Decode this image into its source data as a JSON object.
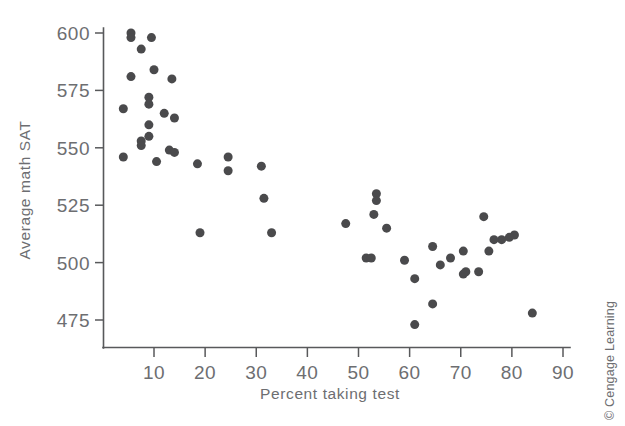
{
  "chart_data": {
    "type": "scatter",
    "title": "",
    "xlabel": "Percent taking test",
    "ylabel": "Average math SAT",
    "xlim": [
      0,
      90
    ],
    "ylim": [
      468,
      604
    ],
    "grid": false,
    "legend": "none",
    "xticks": [
      10,
      20,
      30,
      40,
      50,
      60,
      70,
      80,
      90
    ],
    "yticks": [
      475,
      500,
      525,
      550,
      575,
      600
    ],
    "marker": {
      "shape": "circle",
      "color": "#4a4a4c",
      "size_px": 9
    },
    "points": [
      {
        "x": 5.5,
        "y": 600
      },
      {
        "x": 5.5,
        "y": 598
      },
      {
        "x": 9.5,
        "y": 598
      },
      {
        "x": 7.5,
        "y": 593
      },
      {
        "x": 10.0,
        "y": 584
      },
      {
        "x": 5.5,
        "y": 581
      },
      {
        "x": 13.5,
        "y": 580
      },
      {
        "x": 9.0,
        "y": 572
      },
      {
        "x": 9.0,
        "y": 569
      },
      {
        "x": 4.0,
        "y": 567
      },
      {
        "x": 12.0,
        "y": 565
      },
      {
        "x": 14.0,
        "y": 563
      },
      {
        "x": 9.0,
        "y": 560
      },
      {
        "x": 9.0,
        "y": 555
      },
      {
        "x": 7.5,
        "y": 553
      },
      {
        "x": 7.5,
        "y": 551
      },
      {
        "x": 13.0,
        "y": 549
      },
      {
        "x": 14.0,
        "y": 548
      },
      {
        "x": 4.0,
        "y": 546
      },
      {
        "x": 24.5,
        "y": 546
      },
      {
        "x": 10.5,
        "y": 544
      },
      {
        "x": 18.5,
        "y": 543
      },
      {
        "x": 31.0,
        "y": 542
      },
      {
        "x": 24.5,
        "y": 540
      },
      {
        "x": 31.5,
        "y": 528
      },
      {
        "x": 53.5,
        "y": 530
      },
      {
        "x": 53.5,
        "y": 527
      },
      {
        "x": 53.0,
        "y": 521
      },
      {
        "x": 47.5,
        "y": 517
      },
      {
        "x": 55.5,
        "y": 515
      },
      {
        "x": 74.5,
        "y": 520
      },
      {
        "x": 19.0,
        "y": 513
      },
      {
        "x": 33.0,
        "y": 513
      },
      {
        "x": 80.5,
        "y": 512
      },
      {
        "x": 79.5,
        "y": 511
      },
      {
        "x": 78.0,
        "y": 510
      },
      {
        "x": 76.5,
        "y": 510
      },
      {
        "x": 64.5,
        "y": 507
      },
      {
        "x": 70.5,
        "y": 505
      },
      {
        "x": 75.5,
        "y": 505
      },
      {
        "x": 68.0,
        "y": 502
      },
      {
        "x": 51.5,
        "y": 502
      },
      {
        "x": 52.5,
        "y": 502
      },
      {
        "x": 59.0,
        "y": 501
      },
      {
        "x": 66.0,
        "y": 499
      },
      {
        "x": 71.0,
        "y": 496
      },
      {
        "x": 73.5,
        "y": 496
      },
      {
        "x": 70.5,
        "y": 495
      },
      {
        "x": 61.0,
        "y": 493
      },
      {
        "x": 64.5,
        "y": 482
      },
      {
        "x": 84.0,
        "y": 478
      },
      {
        "x": 61.0,
        "y": 473
      }
    ]
  },
  "credit": {
    "text": "© Cengage Learning"
  },
  "colors": {
    "marker": "#4a4a4c",
    "axis": "#58595b",
    "text": "#6d6e71",
    "background": "#ffffff"
  }
}
